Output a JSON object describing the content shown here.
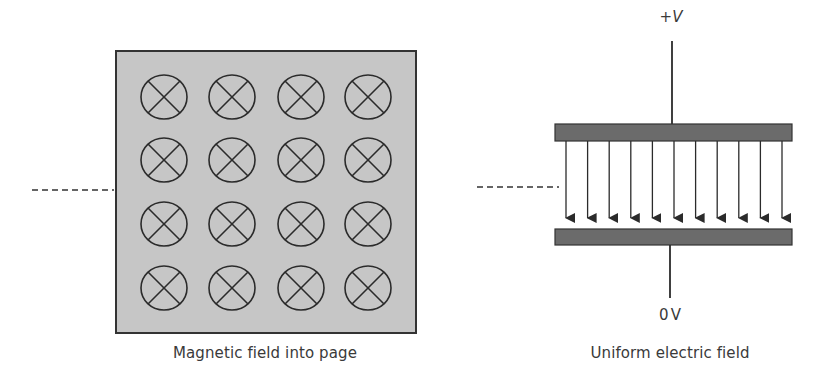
{
  "colors": {
    "magnetic_region_fill": "#c6c6c6",
    "outline": "#333333",
    "plate_fill": "#6b6b6b",
    "text": "#3a3a3a"
  },
  "magnetic_panel": {
    "caption": "Magnetic field into page",
    "symbol": "cross-in-circle (field into page)",
    "grid_rows": 4,
    "grid_cols": 4,
    "entry_path": "dashed line"
  },
  "electric_panel": {
    "caption": "Uniform electric field",
    "top_terminal_sign": "+",
    "top_terminal_symbol": "V",
    "bottom_terminal_label": "0V",
    "field_arrow_count": 11,
    "field_direction": "downward",
    "entry_path": "dashed line"
  }
}
